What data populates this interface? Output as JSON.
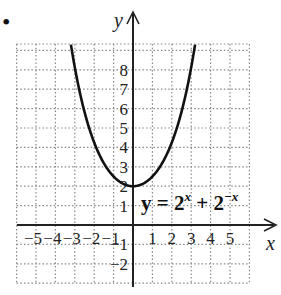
{
  "bullet": "•",
  "chart_data": {
    "type": "line",
    "title": "",
    "xlabel": "x",
    "ylabel": "y",
    "equation": "y = 2^x + 2^{-x}",
    "equation_parts": {
      "lhs": "y = 2",
      "exp1": "x",
      "mid": " + 2",
      "exp2": "−x"
    },
    "xlim": [
      -6,
      6
    ],
    "ylim": [
      -3,
      9.3
    ],
    "grid": true,
    "grid_style": "dotted",
    "x_ticks": [
      "-5",
      "-4",
      "-3",
      "-2",
      "-1",
      "1",
      "2",
      "3",
      "4",
      "5"
    ],
    "y_ticks": [
      "8",
      "7",
      "6",
      "5",
      "4",
      "3",
      "2",
      "1",
      "-1",
      "-2"
    ],
    "series": [
      {
        "name": "y = 2^x + 2^-x",
        "x": [
          -3.2,
          -3,
          -2.5,
          -2,
          -1.5,
          -1,
          -0.5,
          0,
          0.5,
          1,
          1.5,
          2,
          2.5,
          3,
          3.2
        ],
        "y": [
          9.29,
          8.125,
          5.83,
          4.25,
          3.18,
          2.5,
          2.12,
          2,
          2.12,
          2.5,
          3.18,
          4.25,
          5.83,
          8.125,
          9.29
        ]
      }
    ],
    "colors": {
      "curve": "#111111",
      "axes": "#222222",
      "grid": "#888888"
    }
  }
}
